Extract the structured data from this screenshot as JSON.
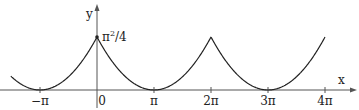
{
  "chart_data": {
    "type": "line",
    "title": "",
    "xlabel": "x",
    "ylabel": "y",
    "function": "periodic extension (period 2π) of f(x) = (x − π)²/4 on [0, 2π]",
    "x_range": [
      -4.75,
      12.566
    ],
    "x_tick_values": [
      -3.14159,
      0,
      3.14159,
      6.28319,
      9.42478,
      12.56637
    ],
    "x_tick_labels": [
      "−π",
      "0",
      "π",
      "2π",
      "3π",
      "4π"
    ],
    "y_annotation": {
      "label": "π²/4",
      "value": 2.4674,
      "x": 0
    },
    "ylim": [
      0,
      2.4674
    ],
    "grid": false,
    "legend": "none",
    "series": [
      {
        "name": "f(x)",
        "x": [
          -4.71,
          -3.93,
          -3.14159,
          -2.36,
          -1.57,
          -0.79,
          0,
          0.79,
          1.57,
          2.36,
          3.14159,
          3.93,
          4.71,
          5.5,
          6.28319,
          7.07,
          7.85,
          8.64,
          9.42478,
          10.21,
          11.0,
          11.78,
          12.56637
        ],
        "y": [
          0.617,
          0.154,
          0,
          0.154,
          0.617,
          1.388,
          2.467,
          1.388,
          0.617,
          0.154,
          0,
          0.154,
          0.617,
          1.388,
          2.467,
          1.388,
          0.617,
          0.154,
          0,
          0.154,
          0.617,
          1.388,
          2.467
        ]
      }
    ]
  },
  "labels": {
    "x_axis": "x",
    "y_axis": "y",
    "peak": "π²/4",
    "ticks": [
      "−π",
      "0",
      "π",
      "2π",
      "3π",
      "4π"
    ]
  },
  "colors": {
    "curve": "#222222",
    "axis": "#555555"
  }
}
